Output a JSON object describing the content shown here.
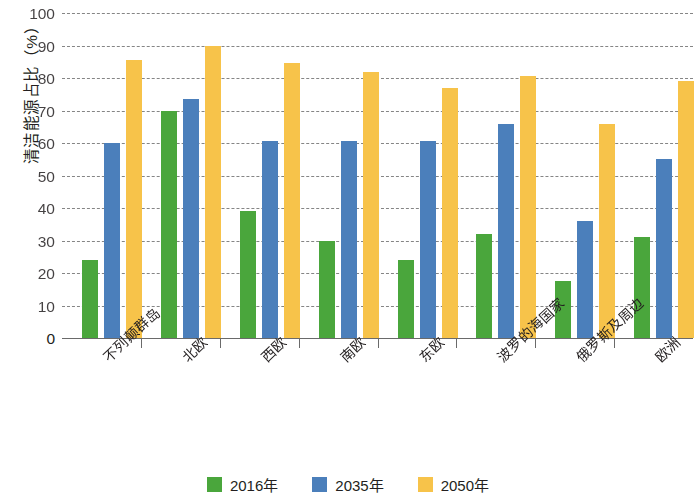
{
  "chart_data": {
    "type": "bar",
    "title": "",
    "xlabel": "",
    "ylabel": "清洁能源占比（%）",
    "ylim": [
      0,
      100
    ],
    "ytick_step": 10,
    "ytick_labels": [
      "100",
      "90",
      "80",
      "70",
      "60",
      "50",
      "40",
      "30",
      "20",
      "10",
      "0"
    ],
    "yticks": [
      100,
      90,
      80,
      70,
      60,
      50,
      40,
      30,
      20,
      10,
      0
    ],
    "grid": true,
    "legend_position": "bottom",
    "categories": [
      "不列颠群岛",
      "北欧",
      "西欧",
      "南欧",
      "东欧",
      "波罗的海国家",
      "俄罗斯及周边",
      "欧洲"
    ],
    "series": [
      {
        "name": "2016年",
        "color": "#4aa63c",
        "values": [
          24,
          70,
          39,
          30,
          24,
          32,
          17.5,
          31
        ]
      },
      {
        "name": "2035年",
        "color": "#4b7fbb",
        "values": [
          60,
          73.5,
          60.5,
          60.5,
          60.5,
          66,
          36,
          55
        ]
      },
      {
        "name": "2050年",
        "color": "#f7c34a",
        "values": [
          85.5,
          90,
          84.5,
          82,
          77,
          80.5,
          66,
          79
        ]
      }
    ]
  },
  "legend": {
    "items": [
      {
        "label": "2016年",
        "color": "#4aa63c"
      },
      {
        "label": "2035年",
        "color": "#4b7fbb"
      },
      {
        "label": "2050年",
        "color": "#f7c34a"
      }
    ]
  }
}
